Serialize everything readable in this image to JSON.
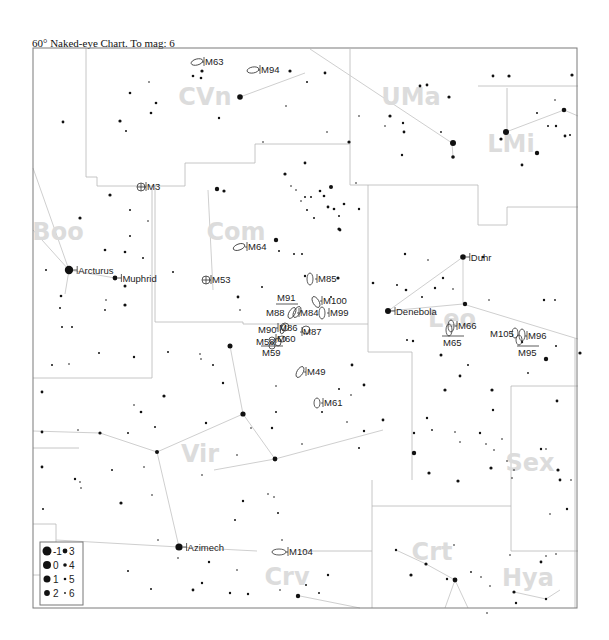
{
  "title": "60° Naked-eye Chart. To mag: 6",
  "frame": {
    "x": 33,
    "y": 48,
    "w": 544,
    "h": 560
  },
  "colors": {
    "stars": "#111111",
    "boundaries": "#b8b8b8",
    "figures": "#cfcfcf",
    "constellation_labels": "#dcdcdc",
    "frame": "#7a7a7a"
  },
  "constellations": [
    {
      "abbr": "CVn",
      "x": 205,
      "y": 105
    },
    {
      "abbr": "UMa",
      "x": 411,
      "y": 105
    },
    {
      "abbr": "LMi",
      "x": 511,
      "y": 152
    },
    {
      "abbr": "Boo",
      "x": 58,
      "y": 240
    },
    {
      "abbr": "Com",
      "x": 236,
      "y": 240
    },
    {
      "abbr": "Leo",
      "x": 452,
      "y": 327
    },
    {
      "abbr": "Vir",
      "x": 200,
      "y": 462
    },
    {
      "abbr": "Sex",
      "x": 530,
      "y": 471
    },
    {
      "abbr": "Crt",
      "x": 432,
      "y": 560
    },
    {
      "abbr": "Crv",
      "x": 287,
      "y": 585
    },
    {
      "abbr": "Hya",
      "x": 528,
      "y": 586
    }
  ],
  "named_stars": [
    {
      "name": "Arcturus",
      "x": 69,
      "y": 270,
      "r": 4.2
    },
    {
      "name": "Muphrid",
      "x": 115,
      "y": 278,
      "r": 2.4
    },
    {
      "name": "Denebola",
      "x": 388,
      "y": 311,
      "r": 3.0
    },
    {
      "name": "Duhr",
      "x": 463,
      "y": 257,
      "r": 2.8
    },
    {
      "name": "Azimech",
      "x": 179,
      "y": 547,
      "r": 3.6
    }
  ],
  "deep_sky_objects": [
    {
      "id": "M63",
      "type": "galaxy",
      "x": 197,
      "y": 62,
      "rx": 6,
      "ry": 3,
      "rot": -15,
      "lx": 205,
      "ly": 65,
      "label_side": "right"
    },
    {
      "id": "M94",
      "type": "galaxy",
      "x": 253,
      "y": 70,
      "rx": 6,
      "ry": 3,
      "rot": -10,
      "lx": 261,
      "ly": 73,
      "label_side": "right"
    },
    {
      "id": "M3",
      "type": "globular",
      "x": 141,
      "y": 187,
      "r": 4,
      "lx": 147,
      "ly": 190,
      "label_side": "right"
    },
    {
      "id": "M64",
      "type": "galaxy",
      "x": 239,
      "y": 247,
      "rx": 6,
      "ry": 3,
      "rot": -20,
      "lx": 248,
      "ly": 250,
      "label_side": "right"
    },
    {
      "id": "M53",
      "type": "globular",
      "x": 206,
      "y": 280,
      "r": 4,
      "lx": 212,
      "ly": 283,
      "label_side": "right"
    },
    {
      "id": "M85",
      "type": "galaxy",
      "x": 310,
      "y": 279,
      "rx": 3,
      "ry": 6,
      "rot": 0,
      "lx": 318,
      "ly": 282,
      "label_side": "right"
    },
    {
      "id": "M91",
      "type": "galaxy",
      "x": 287,
      "y": 300,
      "rx": 0,
      "ry": 0,
      "rot": 0,
      "lx": 277,
      "ly": 301,
      "label_side": "above"
    },
    {
      "id": "M100",
      "type": "galaxy",
      "x": 316,
      "y": 302,
      "rx": 3,
      "ry": 6,
      "rot": -30,
      "lx": 323,
      "ly": 304,
      "label_side": "right"
    },
    {
      "id": "M88",
      "type": "galaxy",
      "x": 292,
      "y": 313,
      "rx": 3,
      "ry": 6,
      "rot": 30,
      "lx": 266,
      "ly": 316,
      "label_side": "left"
    },
    {
      "id": "M84",
      "type": "galaxy",
      "x": 297,
      "y": 312,
      "rx": 3,
      "ry": 6,
      "rot": 30,
      "lx": 300,
      "ly": 316,
      "label_side": "right"
    },
    {
      "id": "M99",
      "type": "galaxy",
      "x": 322,
      "y": 313,
      "rx": 3,
      "ry": 6,
      "rot": 0,
      "lx": 330,
      "ly": 316,
      "label_side": "right"
    },
    {
      "id": "M90",
      "type": "galaxy",
      "x": 283,
      "y": 329,
      "rx": 2,
      "ry": 5,
      "rot": 20,
      "lx": 258,
      "ly": 333,
      "label_side": "left"
    },
    {
      "id": "M86",
      "type": "galaxy",
      "x": 285,
      "y": 327,
      "rx": 4,
      "ry": 4,
      "rot": 0,
      "lx": 279,
      "ly": 331,
      "label_side": "right"
    },
    {
      "id": "M87",
      "type": "galaxy",
      "x": 306,
      "y": 330,
      "rx": 4,
      "ry": 4,
      "rot": 0,
      "lx": 303,
      "ly": 335,
      "label_side": "right"
    },
    {
      "id": "M58",
      "type": "galaxy",
      "x": 278,
      "y": 342,
      "rx": 3,
      "ry": 4,
      "rot": 0,
      "lx": 256,
      "ly": 345,
      "label_side": "left"
    },
    {
      "id": "M60",
      "type": "galaxy",
      "x": 282,
      "y": 339,
      "rx": 4,
      "ry": 3,
      "rot": 0,
      "lx": 277,
      "ly": 342,
      "label_side": "right"
    },
    {
      "id": "M89",
      "type": "galaxy",
      "x": 272,
      "y": 340,
      "rx": 3,
      "ry": 3,
      "rot": 0,
      "lx": 0,
      "ly": 0,
      "label_side": "none"
    },
    {
      "id": "M59",
      "type": "galaxy",
      "x": 272,
      "y": 346,
      "rx": 3,
      "ry": 3,
      "rot": 0,
      "lx": 262,
      "ly": 356,
      "label_side": "below"
    },
    {
      "id": "M49",
      "type": "galaxy",
      "x": 300,
      "y": 372,
      "rx": 3,
      "ry": 6,
      "rot": 30,
      "lx": 307,
      "ly": 375,
      "label_side": "right"
    },
    {
      "id": "M61",
      "type": "galaxy",
      "x": 317,
      "y": 403,
      "rx": 3,
      "ry": 5,
      "rot": 0,
      "lx": 324,
      "ly": 406,
      "label_side": "right"
    },
    {
      "id": "M66",
      "type": "galaxy",
      "x": 451,
      "y": 326,
      "rx": 3,
      "ry": 6,
      "rot": 0,
      "lx": 458,
      "ly": 329,
      "label_side": "right"
    },
    {
      "id": "M65",
      "type": "galaxy",
      "x": 449,
      "y": 330,
      "rx": 3,
      "ry": 6,
      "rot": 0,
      "lx": 443,
      "ly": 346,
      "label_side": "below"
    },
    {
      "id": "M105",
      "type": "galaxy",
      "x": 515,
      "y": 333,
      "rx": 3,
      "ry": 5,
      "rot": 0,
      "lx": 490,
      "ly": 337,
      "label_side": "left"
    },
    {
      "id": "M96",
      "type": "galaxy",
      "x": 522,
      "y": 335,
      "rx": 3,
      "ry": 6,
      "rot": 0,
      "lx": 528,
      "ly": 339,
      "label_side": "right"
    },
    {
      "id": "M95",
      "type": "galaxy",
      "x": 519,
      "y": 340,
      "rx": 3,
      "ry": 5,
      "rot": 0,
      "lx": 518,
      "ly": 356,
      "label_side": "below"
    },
    {
      "id": "M104",
      "type": "galaxy",
      "x": 279,
      "y": 552,
      "rx": 7,
      "ry": 3,
      "rot": 0,
      "lx": 289,
      "ly": 555,
      "label_side": "right"
    }
  ],
  "legend": {
    "title": "Magnitude scale",
    "entries": [
      {
        "mag": "-1",
        "r": 4.5
      },
      {
        "mag": "3",
        "r": 2.4
      },
      {
        "mag": "0",
        "r": 4.0
      },
      {
        "mag": "4",
        "r": 1.8
      },
      {
        "mag": "1",
        "r": 3.5
      },
      {
        "mag": "5",
        "r": 1.3
      },
      {
        "mag": "2",
        "r": 2.9
      },
      {
        "mag": "6",
        "r": 0.9
      }
    ]
  },
  "stars": [
    [
      240,
      97,
      2.8
    ],
    [
      290,
      71,
      1.6
    ],
    [
      202,
      71,
      1.6
    ],
    [
      193,
      76,
      1.3
    ],
    [
      201,
      78,
      1.3
    ],
    [
      149,
      82,
      0.8
    ],
    [
      130,
      93,
      1.3
    ],
    [
      156,
      103,
      1.3
    ],
    [
      151,
      113,
      1.3
    ],
    [
      120,
      121,
      1.6
    ],
    [
      219,
      118,
      1.2
    ],
    [
      63,
      122,
      1.4
    ],
    [
      126,
      131,
      1.0
    ],
    [
      325,
      73,
      1.4
    ],
    [
      307,
      82,
      1.0
    ],
    [
      263,
      142,
      0.8
    ],
    [
      286,
      106,
      0.8
    ],
    [
      327,
      132,
      0.8
    ],
    [
      493,
      76,
      1.4
    ],
    [
      420,
      86,
      1.4
    ],
    [
      449,
      97,
      1.6
    ],
    [
      427,
      85,
      1.4
    ],
    [
      390,
      116,
      1.6
    ],
    [
      403,
      123,
      1.2
    ],
    [
      359,
      116,
      0.8
    ],
    [
      385,
      126,
      0.8
    ],
    [
      404,
      132,
      1.4
    ],
    [
      402,
      155,
      1.2
    ],
    [
      453,
      143,
      3.0
    ],
    [
      453,
      157,
      1.8
    ],
    [
      349,
      142,
      1.6
    ],
    [
      441,
      132,
      0.9
    ],
    [
      509,
      76,
      1.6
    ],
    [
      564,
      110,
      2.3
    ],
    [
      556,
      126,
      1.2
    ],
    [
      506,
      132,
      3.0
    ],
    [
      501,
      139,
      1.6
    ],
    [
      537,
      153,
      2.2
    ],
    [
      565,
      136,
      1.4
    ],
    [
      570,
      135,
      1.0
    ],
    [
      548,
      126,
      1.0
    ],
    [
      522,
      165,
      1.4
    ],
    [
      537,
      113,
      1.0
    ],
    [
      555,
      100,
      0.8
    ],
    [
      572,
      75,
      1.6
    ],
    [
      305,
      163,
      1.4
    ],
    [
      320,
      191,
      1.3
    ],
    [
      311,
      197,
      1.0
    ],
    [
      305,
      197,
      1.0
    ],
    [
      331,
      187,
      2.0
    ],
    [
      324,
      196,
      1.3
    ],
    [
      328,
      207,
      1.4
    ],
    [
      334,
      209,
      1.3
    ],
    [
      339,
      229,
      1.6
    ],
    [
      285,
      174,
      1.6
    ],
    [
      217,
      189,
      2.2
    ],
    [
      224,
      191,
      1.6
    ],
    [
      301,
      201,
      0.8
    ],
    [
      307,
      210,
      1.0
    ],
    [
      314,
      218,
      1.0
    ],
    [
      276,
      240,
      2.2
    ],
    [
      279,
      251,
      1.0
    ],
    [
      294,
      254,
      1.0
    ],
    [
      302,
      254,
      1.0
    ],
    [
      338,
      278,
      1.6
    ],
    [
      331,
      297,
      1.0
    ],
    [
      344,
      204,
      1.3
    ],
    [
      339,
      216,
      1.0
    ],
    [
      340,
      230,
      1.4
    ],
    [
      305,
      276,
      1.2
    ],
    [
      356,
      183,
      0.8
    ],
    [
      359,
      209,
      1.2
    ],
    [
      291,
      186,
      0.8
    ],
    [
      296,
      190,
      0.8
    ],
    [
      110,
      195,
      1.6
    ],
    [
      130,
      210,
      1.0
    ],
    [
      80,
      218,
      1.6
    ],
    [
      130,
      236,
      1.0
    ],
    [
      105,
      250,
      1.3
    ],
    [
      125,
      252,
      1.3
    ],
    [
      143,
      258,
      1.0
    ],
    [
      125,
      286,
      1.5
    ],
    [
      125,
      305,
      1.6
    ],
    [
      46,
      270,
      1.0
    ],
    [
      61,
      296,
      1.3
    ],
    [
      60,
      308,
      1.0
    ],
    [
      105,
      310,
      0.9
    ],
    [
      62,
      327,
      1.0
    ],
    [
      72,
      327,
      1.0
    ],
    [
      106,
      300,
      0.8
    ],
    [
      173,
      272,
      1.0
    ],
    [
      148,
      221,
      0.8
    ],
    [
      238,
      297,
      1.4
    ],
    [
      240,
      310,
      0.8
    ],
    [
      262,
      287,
      1.0
    ],
    [
      230,
      346,
      2.5
    ],
    [
      168,
      352,
      1.0
    ],
    [
      134,
      357,
      1.2
    ],
    [
      99,
      353,
      1.0
    ],
    [
      200,
      354,
      0.8
    ],
    [
      201,
      359,
      0.8
    ],
    [
      213,
      365,
      1.0
    ],
    [
      223,
      383,
      1.2
    ],
    [
      52,
      365,
      1.0
    ],
    [
      42,
      392,
      1.4
    ],
    [
      69,
      364,
      0.8
    ],
    [
      164,
      396,
      1.6
    ],
    [
      141,
      412,
      1.3
    ],
    [
      134,
      405,
      0.8
    ],
    [
      243,
      414,
      2.6
    ],
    [
      251,
      428,
      0.8
    ],
    [
      237,
      455,
      0.8
    ],
    [
      206,
      423,
      1.2
    ],
    [
      155,
      427,
      1.0
    ],
    [
      272,
      428,
      1.2
    ],
    [
      276,
      386,
      0.8
    ],
    [
      276,
      412,
      1.0
    ],
    [
      302,
      444,
      0.8
    ],
    [
      322,
      412,
      1.0
    ],
    [
      352,
      365,
      1.4
    ],
    [
      364,
      385,
      1.4
    ],
    [
      351,
      395,
      0.8
    ],
    [
      364,
      431,
      1.2
    ],
    [
      339,
      389,
      1.0
    ],
    [
      383,
      420,
      1.4
    ],
    [
      275,
      459,
      2.4
    ],
    [
      359,
      448,
      1.0
    ],
    [
      347,
      422,
      0.8
    ],
    [
      100,
      433,
      1.6
    ],
    [
      42,
      432,
      1.4
    ],
    [
      128,
      433,
      1.0
    ],
    [
      78,
      430,
      0.8
    ],
    [
      42,
      467,
      1.4
    ],
    [
      157,
      452,
      2.0
    ],
    [
      202,
      475,
      0.8
    ],
    [
      75,
      479,
      1.2
    ],
    [
      112,
      470,
      1.0
    ],
    [
      152,
      495,
      0.8
    ],
    [
      121,
      503,
      1.6
    ],
    [
      43,
      509,
      1.0
    ],
    [
      144,
      467,
      0.8
    ],
    [
      81,
      488,
      0.8
    ],
    [
      158,
      540,
      0.8
    ],
    [
      80,
      482,
      0.8
    ],
    [
      243,
      501,
      1.2
    ],
    [
      235,
      520,
      1.0
    ],
    [
      278,
      513,
      1.0
    ],
    [
      282,
      540,
      0.8
    ],
    [
      274,
      497,
      0.8
    ],
    [
      268,
      494,
      0.8
    ],
    [
      280,
      590,
      0.8
    ],
    [
      328,
      575,
      1.2
    ],
    [
      319,
      593,
      1.0
    ],
    [
      298,
      596,
      2.2
    ],
    [
      306,
      585,
      1.0
    ],
    [
      209,
      562,
      1.2
    ],
    [
      178,
      558,
      0.8
    ],
    [
      237,
      570,
      0.8
    ],
    [
      128,
      571,
      1.0
    ],
    [
      151,
      589,
      1.0
    ],
    [
      193,
      590,
      1.4
    ],
    [
      202,
      583,
      1.2
    ],
    [
      248,
      594,
      1.2
    ],
    [
      230,
      593,
      1.2
    ],
    [
      445,
      390,
      1.6
    ],
    [
      492,
      390,
      1.6
    ],
    [
      493,
      410,
      1.2
    ],
    [
      427,
      418,
      1.2
    ],
    [
      432,
      430,
      0.9
    ],
    [
      414,
      433,
      1.2
    ],
    [
      455,
      432,
      0.8
    ],
    [
      480,
      433,
      1.2
    ],
    [
      460,
      442,
      0.8
    ],
    [
      486,
      444,
      0.8
    ],
    [
      502,
      439,
      0.8
    ],
    [
      494,
      450,
      0.8
    ],
    [
      414,
      453,
      2.2
    ],
    [
      429,
      473,
      1.6
    ],
    [
      458,
      481,
      1.6
    ],
    [
      491,
      468,
      1.6
    ],
    [
      507,
      461,
      0.8
    ],
    [
      514,
      470,
      0.8
    ],
    [
      512,
      478,
      0.8
    ],
    [
      541,
      449,
      1.2
    ],
    [
      546,
      449,
      0.8
    ],
    [
      558,
      470,
      1.6
    ],
    [
      560,
      480,
      1.4
    ],
    [
      571,
      480,
      0.8
    ],
    [
      567,
      509,
      1.2
    ],
    [
      557,
      401,
      1.4
    ],
    [
      580,
      353,
      1.6
    ],
    [
      460,
      376,
      1.4
    ],
    [
      468,
      365,
      1.0
    ],
    [
      435,
      288,
      1.2
    ],
    [
      443,
      278,
      1.2
    ],
    [
      465,
      304,
      2.2
    ],
    [
      406,
      290,
      1.3
    ],
    [
      428,
      260,
      0.8
    ],
    [
      405,
      254,
      1.2
    ],
    [
      397,
      285,
      1.0
    ],
    [
      489,
      300,
      0.8
    ],
    [
      522,
      342,
      1.2
    ],
    [
      555,
      300,
      0.9
    ],
    [
      546,
      359,
      2.2
    ],
    [
      556,
      346,
      1.0
    ],
    [
      528,
      373,
      0.9
    ],
    [
      373,
      283,
      1.3
    ],
    [
      483,
      257,
      1.3
    ],
    [
      453,
      289,
      0.8
    ],
    [
      413,
      341,
      1.2
    ],
    [
      441,
      355,
      1.5
    ],
    [
      407,
      340,
      1.0
    ],
    [
      422,
      297,
      1.0
    ],
    [
      544,
      300,
      1.2
    ],
    [
      396,
      550,
      1.2
    ],
    [
      426,
      564,
      1.6
    ],
    [
      454,
      545,
      0.8
    ],
    [
      411,
      575,
      1.6
    ],
    [
      447,
      579,
      1.2
    ],
    [
      471,
      572,
      0.9
    ],
    [
      490,
      586,
      0.8
    ],
    [
      481,
      577,
      0.8
    ],
    [
      455,
      580,
      2.4
    ],
    [
      487,
      613,
      0.8
    ],
    [
      514,
      592,
      1.6
    ],
    [
      516,
      603,
      1.2
    ],
    [
      546,
      599,
      1.2
    ],
    [
      541,
      562,
      1.4
    ],
    [
      546,
      556,
      0.8
    ],
    [
      556,
      554,
      0.8
    ],
    [
      510,
      555,
      0.8
    ],
    [
      550,
      514,
      0.8
    ]
  ]
}
